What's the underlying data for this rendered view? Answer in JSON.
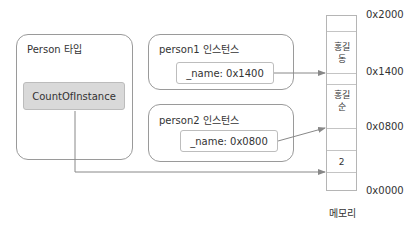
{
  "type_box": {
    "title": "Person 타입",
    "field": "CountOfInstance"
  },
  "instances": [
    {
      "title": "person1 인스턴스",
      "field": "_name: 0x1400"
    },
    {
      "title": "person2 인스턴스",
      "field": "_name: 0x0800"
    }
  ],
  "memory": {
    "label": "메모리",
    "cells": [
      {
        "value": ""
      },
      {
        "value": "홍길\n동"
      },
      {
        "value": ""
      },
      {
        "value": "홍길\n순"
      },
      {
        "value": ""
      },
      {
        "value": "2"
      },
      {
        "value": ""
      }
    ],
    "addresses": [
      "0x2000",
      "0x1400",
      "0x0800",
      "0x0000"
    ]
  },
  "colors": {
    "box_border": "#9a9a9a",
    "count_fill": "#d9d9d9",
    "arrow": "#888888"
  }
}
